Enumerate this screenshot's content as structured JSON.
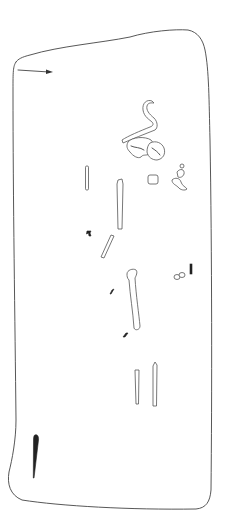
{
  "figure": {
    "type": "archaeological grave plan drawing",
    "width": 226,
    "height": 525,
    "colors": {
      "background": "#ffffff",
      "line": "#444444",
      "fill_dark": "#222222"
    },
    "elements": [
      {
        "name": "grave-outline"
      },
      {
        "name": "north-arrow"
      },
      {
        "name": "skull-fragments"
      },
      {
        "name": "mandible"
      },
      {
        "name": "hand-bones"
      },
      {
        "name": "long-bones"
      },
      {
        "name": "femur"
      },
      {
        "name": "tibia-fibula"
      },
      {
        "name": "iron-knife"
      },
      {
        "name": "small-finds"
      }
    ]
  }
}
